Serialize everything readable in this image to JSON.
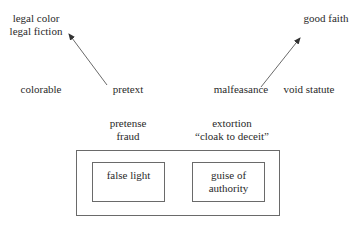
{
  "diagram": {
    "top_left": {
      "line1": "legal color",
      "line2": "legal fiction"
    },
    "top_right": "good faith",
    "row": {
      "colorable": "colorable",
      "pretext": "pretext",
      "malfeasance": "malfeasance",
      "void_statute": "void statute"
    },
    "lower_left": {
      "line1": "pretense",
      "line2": "fraud"
    },
    "lower_right": {
      "line1": "extortion",
      "line2": "“cloak to deceit”"
    },
    "outer_box": {
      "left_box": "false light",
      "right_box": {
        "line1": "guise of",
        "line2": "authority"
      }
    },
    "arrows": [
      {
        "from": "pretext",
        "to": "legal color / legal fiction"
      },
      {
        "from": "malfeasance",
        "to": "good faith"
      }
    ],
    "colors": {
      "line": "#6a6a6a",
      "text": "#2a2a2a"
    }
  }
}
